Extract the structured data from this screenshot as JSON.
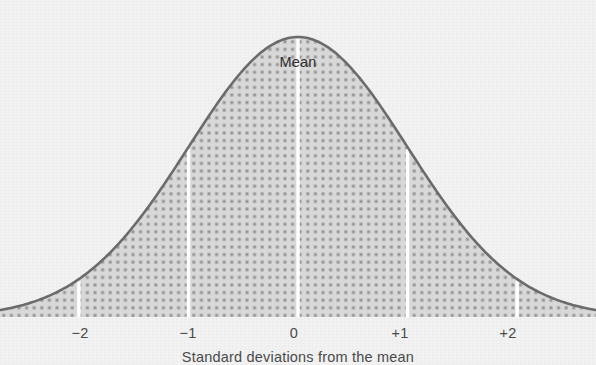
{
  "figure": {
    "width": 596,
    "height": 365,
    "background_color": "#f2f2f2",
    "curve_stroke_color": "#6b6b6b",
    "fill_dot_color": "#8a8a8a",
    "fill_base_color": "#cccccc",
    "tick_line_color": "#ffffff",
    "text_color": "#4a4a4a"
  },
  "annotations": {
    "mean_label": "Mean"
  },
  "axis": {
    "caption": "Standard deviations from the mean",
    "tick_labels": [
      "−2",
      "−1",
      "0",
      "+1",
      "+2"
    ]
  },
  "chart_data": {
    "type": "area",
    "title": "",
    "subtitle": "",
    "xlabel": "Standard deviations from the mean",
    "ylabel": "",
    "distribution": "normal",
    "mean": 0,
    "sd": 1,
    "xlim": [
      -2.72,
      2.72
    ],
    "ylim": [
      0,
      1
    ],
    "grid": false,
    "legend": false,
    "annotations": [
      {
        "text": "Mean",
        "x": 0,
        "y": 0.88
      }
    ],
    "tick_values": [
      -2,
      -1,
      0,
      1,
      2
    ],
    "tick_labels": [
      "−2",
      "−1",
      "0",
      "+1",
      "+2"
    ],
    "tick_label_px_x": [
      80,
      188,
      294,
      400,
      508
    ],
    "vertical_rules": [
      {
        "x": -2,
        "height_fraction": 0.135
      },
      {
        "x": -1,
        "height_fraction": 0.607
      },
      {
        "x": 0,
        "height_fraction": 1.0
      },
      {
        "x": 1,
        "height_fraction": 0.607
      },
      {
        "x": 2,
        "height_fraction": 0.135
      }
    ],
    "x": [
      -2.72,
      -2.55,
      -2.38,
      -2.21,
      -2.04,
      -1.87,
      -1.7,
      -1.53,
      -1.36,
      -1.19,
      -1.02,
      -0.85,
      -0.68,
      -0.51,
      -0.34,
      -0.17,
      0,
      0.17,
      0.34,
      0.51,
      0.68,
      0.85,
      1.02,
      1.19,
      1.36,
      1.53,
      1.7,
      1.87,
      2.04,
      2.21,
      2.38,
      2.55,
      2.72
    ],
    "y": [
      0.025,
      0.039,
      0.058,
      0.086,
      0.123,
      0.173,
      0.235,
      0.31,
      0.395,
      0.492,
      0.594,
      0.696,
      0.794,
      0.878,
      0.944,
      0.986,
      1.0,
      0.986,
      0.944,
      0.878,
      0.794,
      0.696,
      0.594,
      0.492,
      0.395,
      0.31,
      0.235,
      0.173,
      0.123,
      0.086,
      0.058,
      0.039,
      0.025
    ]
  }
}
